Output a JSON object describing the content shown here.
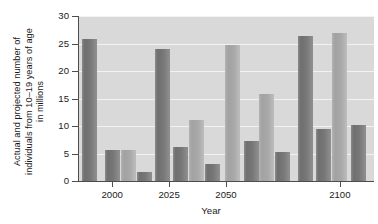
{
  "chart_data": {
    "type": "bar",
    "title": "",
    "subtitle": "",
    "xlabel": "Year",
    "ylabel": "Actual and projected number of\nindividuals from 10–19 years of age\nin millions",
    "ylabel_lines": [
      "Actual and projected number of",
      "individuals from 10–19 years of age",
      "in millions"
    ],
    "ylim": [
      0,
      30
    ],
    "ytick_values": [
      0,
      5,
      10,
      15,
      20,
      25,
      30
    ],
    "ytick_labels": [
      "0",
      "5",
      "10",
      "15",
      "20",
      "25",
      "30"
    ],
    "xlim": [
      1985,
      2115
    ],
    "xtick_values": [
      2000,
      2025,
      2050,
      2100
    ],
    "xtick_labels": [
      "2000",
      "2025",
      "2050",
      "2100"
    ],
    "grid": true,
    "grid_axis": "y",
    "legend": false,
    "legend_position": "none",
    "bar_count": 12,
    "bars": [
      {
        "label": "bar-1",
        "x": 1990,
        "value": 25.9,
        "shade": "dark"
      },
      {
        "label": "bar-2",
        "x": 2000,
        "value": 5.7,
        "shade": "dark"
      },
      {
        "label": "bar-3",
        "x": 2007,
        "value": 5.7,
        "shade": "light"
      },
      {
        "label": "bar-4",
        "x": 2014,
        "value": 1.6,
        "shade": "dark"
      },
      {
        "label": "bar-5",
        "x": 2022,
        "value": 24.0,
        "shade": "dark"
      },
      {
        "label": "bar-6",
        "x": 2030,
        "value": 6.2,
        "shade": "dark"
      },
      {
        "label": "bar-7",
        "x": 2037,
        "value": 11.1,
        "shade": "light"
      },
      {
        "label": "bar-8",
        "x": 2044,
        "value": 3.1,
        "shade": "dark"
      },
      {
        "label": "bar-9",
        "x": 2053,
        "value": 24.8,
        "shade": "light"
      },
      {
        "label": "bar-10",
        "x": 2061,
        "value": 7.2,
        "shade": "dark"
      },
      {
        "label": "bar-11",
        "x": 2068,
        "value": 15.8,
        "shade": "light"
      },
      {
        "label": "bar-12",
        "x": 2075,
        "value": 5.3,
        "shade": "dark"
      },
      {
        "label": "bar-13",
        "x": 2085,
        "value": 26.4,
        "shade": "dark"
      },
      {
        "label": "bar-14",
        "x": 2093,
        "value": 9.5,
        "shade": "dark"
      },
      {
        "label": "bar-15",
        "x": 2100,
        "value": 27.0,
        "shade": "light"
      },
      {
        "label": "bar-16",
        "x": 2108,
        "value": 10.1,
        "shade": "dark"
      }
    ],
    "colors": {
      "bar_dark": "#757575",
      "bar_light": "#ababab",
      "plot_background": "#d9d9d9",
      "gridline": "#f2f2f2",
      "axis": "#4d4d4d",
      "text": "#1a1a1a",
      "page_background": "#ffffff"
    }
  }
}
